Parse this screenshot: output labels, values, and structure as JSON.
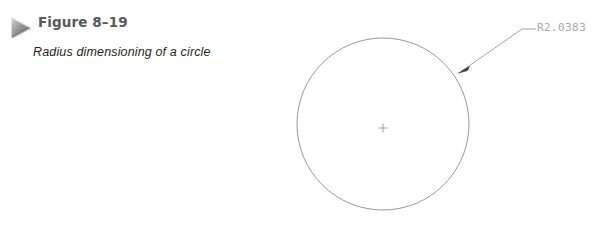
{
  "page": {
    "background_color": "#ffffff",
    "width": 607,
    "height": 228
  },
  "caption": {
    "marker_icon": "triangle-right-icon",
    "figure_number": "Figure 8–19",
    "figure_number_color": "#58595b",
    "caption_text": "Radius dimensioning of a circle",
    "caption_color": "#231f20"
  },
  "drawing": {
    "type": "cad-technical-drawing",
    "subject": "circle-with-radius-dimension",
    "line_color": "#8c8c8c",
    "circle": {
      "center_x": 383,
      "center_y": 124,
      "radius": 86,
      "stroke_color": "#8c8c8c",
      "stroke_width": 0.9
    },
    "center_mark": {
      "symbol": "+",
      "x": 383,
      "y": 128,
      "size": 9,
      "color": "#8a8a8a"
    },
    "leader": {
      "arrow_tip_x": 459,
      "arrow_tip_y": 73,
      "elbow_x": 522,
      "elbow_y": 29,
      "landing_end_x": 536,
      "landing_end_y": 29,
      "stroke_color": "#9a9a9a",
      "arrowhead_color": "#3a3a3a"
    },
    "dimension_label": "R2.0383",
    "dimension_label_color": "#a8a8a8"
  }
}
